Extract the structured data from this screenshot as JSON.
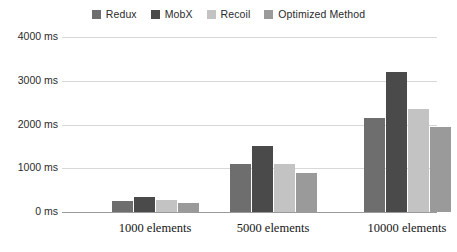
{
  "chart_data": {
    "type": "bar",
    "title": "",
    "subtitle": "",
    "xlabel": "",
    "ylabel": "",
    "categories": [
      "1000 elements",
      "5000 elements",
      "10000 elements"
    ],
    "series": [
      {
        "name": "Redux",
        "color": "#6e6e6e",
        "values": [
          250,
          1100,
          2150
        ]
      },
      {
        "name": "MobX",
        "color": "#4a4a4a",
        "values": [
          350,
          1500,
          3200
        ]
      },
      {
        "name": "Recoil",
        "color": "#c3c3c3",
        "values": [
          270,
          1100,
          2350
        ]
      },
      {
        "name": "Optimized Method",
        "color": "#9a9a9a",
        "values": [
          200,
          900,
          1950
        ]
      }
    ],
    "ylim": [
      0,
      4000
    ],
    "yticks": [
      0,
      1000,
      2000,
      3000,
      4000
    ],
    "ytick_labels": [
      "0 ms",
      "1000 ms",
      "2000 ms",
      "3000 ms",
      "4000 ms"
    ],
    "yunit": "ms",
    "grid": true,
    "legend_position": "top-center"
  },
  "legend": {
    "items": [
      {
        "label": "Redux"
      },
      {
        "label": "MobX"
      },
      {
        "label": "Recoil"
      },
      {
        "label": "Optimized Method"
      }
    ]
  },
  "axes": {
    "y_labels": [
      "4000 ms",
      "3000 ms",
      "2000 ms",
      "1000 ms",
      "0 ms"
    ],
    "x_labels": [
      "1000 elements",
      "5000 elements",
      "10000 elements"
    ]
  },
  "colors": {
    "redux": "#6e6e6e",
    "mobx": "#4a4a4a",
    "recoil": "#c3c3c3",
    "optimized": "#9a9a9a",
    "gridline": "#d8d8d8",
    "axis": "#9a9a9a",
    "text": "#1d1d1d"
  }
}
